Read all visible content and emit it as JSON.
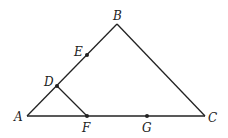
{
  "diagram": {
    "type": "geometry-triangle",
    "points": {
      "A": {
        "label": "A",
        "x": 27,
        "y": 116
      },
      "B": {
        "label": "B",
        "x": 117,
        "y": 24
      },
      "C": {
        "label": "C",
        "x": 205,
        "y": 116
      },
      "D": {
        "label": "D",
        "x": 57,
        "y": 86
      },
      "E": {
        "label": "E",
        "x": 87,
        "y": 55
      },
      "F": {
        "label": "F",
        "x": 87,
        "y": 116
      },
      "G": {
        "label": "G",
        "x": 147,
        "y": 116
      }
    },
    "segments": [
      "AB",
      "BC",
      "AC",
      "DF"
    ],
    "marked_points": [
      "D",
      "E",
      "F",
      "G"
    ]
  }
}
